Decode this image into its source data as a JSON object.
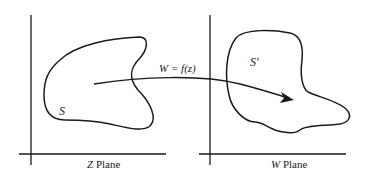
{
  "diagram": {
    "mapping_label": "W = f(z)",
    "left_panel": {
      "region_label": "S",
      "plane_var": "Z",
      "plane_word": "Plane"
    },
    "right_panel": {
      "region_label": "S′",
      "plane_var": "W",
      "plane_word": "Plane"
    },
    "colors": {
      "ink": "#1a1a1a",
      "background": "#ffffff"
    }
  }
}
